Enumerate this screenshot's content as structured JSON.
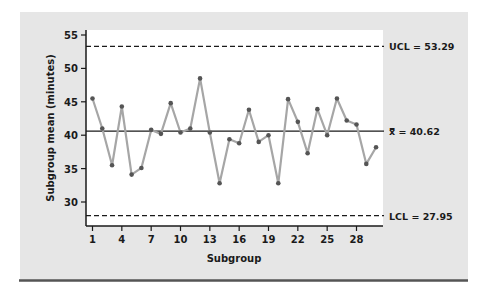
{
  "chart_data": {
    "type": "line",
    "title": "",
    "xlabel": "Subgroup",
    "ylabel": "Subgroup mean (minutes)",
    "x": [
      1,
      2,
      3,
      4,
      5,
      6,
      7,
      8,
      9,
      10,
      11,
      12,
      13,
      14,
      15,
      16,
      17,
      18,
      19,
      20,
      21,
      22,
      23,
      24,
      25,
      26,
      27,
      28,
      29,
      30
    ],
    "series": [
      {
        "name": "Subgroup mean",
        "values": [
          45.5,
          41.0,
          35.5,
          44.3,
          34.1,
          35.1,
          40.8,
          40.2,
          44.8,
          40.4,
          41.0,
          48.5,
          40.4,
          32.8,
          39.4,
          38.8,
          43.8,
          39.0,
          40.0,
          32.8,
          45.4,
          42.0,
          37.3,
          43.9,
          40.0,
          45.5,
          42.2,
          41.6,
          35.7,
          38.2
        ],
        "color": "#a6a6a6",
        "marker_color": "#555555"
      }
    ],
    "x_ticks": [
      1,
      4,
      7,
      10,
      13,
      16,
      19,
      22,
      25,
      28
    ],
    "y_ticks": [
      30,
      35,
      40,
      45,
      50,
      55
    ],
    "ylim": [
      26.3,
      56
    ],
    "xlim": [
      0.4,
      30.6
    ],
    "grid": false,
    "legend": "none",
    "reference_lines": [
      {
        "name": "UCL",
        "value": 53.29,
        "label": "UCL = 53.29",
        "style": "dashed"
      },
      {
        "name": "center",
        "value": 40.62,
        "label": "x̿ = 40.62",
        "style": "solid"
      },
      {
        "name": "LCL",
        "value": 27.95,
        "label": "LCL = 27.95",
        "style": "dashed"
      }
    ]
  },
  "colors": {
    "panel_bg": "#e6e6e6",
    "plot_bg": "#ffffff",
    "axis": "#1a1a1a",
    "rule": "#555555"
  }
}
